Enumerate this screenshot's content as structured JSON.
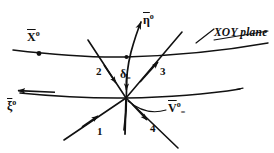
{
  "figure": {
    "type": "technical-line-diagram",
    "width": 274,
    "height": 153,
    "ink_color": "#111111",
    "background_color": "#ffffff"
  },
  "curves": {
    "xoy_trace": {
      "name": "XOY plane trace",
      "label": "XOY plane"
    },
    "lower_surface": {
      "name": "lower surface trace",
      "label": "ξ°"
    }
  },
  "labels": {
    "x_axis": {
      "base": "X",
      "degree": "o"
    },
    "eta_axis": {
      "base": "η",
      "degree": "o"
    },
    "xi_axis": {
      "base": "ξ",
      "degree": "o"
    },
    "velocity": {
      "base": "V",
      "degree": "o",
      "subscript": "="
    },
    "delta": {
      "base": "δ",
      "subscript": "="
    },
    "plane": "XOY plane",
    "ray_1": "1",
    "ray_2": "2",
    "ray_3": "3",
    "ray_4": "4"
  },
  "rays": [
    {
      "id": "1",
      "label": "1",
      "direction": "lower-left",
      "arrow": "toward-origin"
    },
    {
      "id": "2",
      "label": "2",
      "direction": "upper-left",
      "arrow": "toward-origin"
    },
    {
      "id": "3",
      "label": "3",
      "direction": "upper-right",
      "arrow": "away-from-origin"
    },
    {
      "id": "4",
      "label": "4",
      "direction": "lower-right",
      "arrow": "away-from-origin"
    }
  ],
  "origin": {
    "x": 126,
    "y": 98,
    "name": "convergence-point"
  }
}
